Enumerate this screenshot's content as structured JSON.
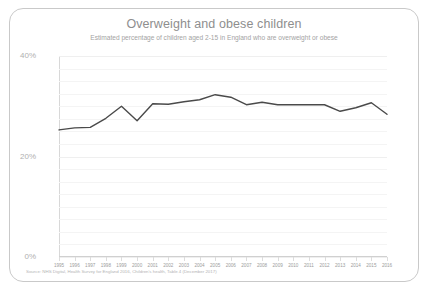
{
  "card": {
    "title": "Overweight and obese children",
    "subtitle": "Estimated percentage of children aged 2-15 in England who are overweight or obese",
    "source": "Source: NHS Digital, Health Survey for England 2016, Children's health, Table 4 (December 2017)",
    "border_color": "#c9c9c9",
    "background": "#ffffff"
  },
  "chart_data": {
    "type": "line",
    "title": "Overweight and obese children",
    "subtitle": "Estimated percentage of children aged 2-15 in England who are overweight or obese",
    "xlabel": "",
    "ylabel": "",
    "ylim": [
      0,
      40
    ],
    "yticks": [
      0,
      20,
      40
    ],
    "ytick_labels": [
      "0%",
      "20%",
      "40%"
    ],
    "grid": true,
    "legend": "none",
    "line_color": "#4a4a4a",
    "categories": [
      "1995",
      "1996",
      "1997",
      "1998",
      "1999",
      "2000",
      "2001",
      "2002",
      "2003",
      "2004",
      "2005",
      "2006",
      "2007",
      "2008",
      "2009",
      "2010",
      "2011",
      "2012",
      "2013",
      "2014",
      "2015",
      "2016"
    ],
    "values": [
      25.3,
      25.7,
      25.8,
      27.6,
      30.0,
      27.1,
      30.5,
      30.4,
      30.9,
      31.3,
      32.3,
      31.8,
      30.3,
      30.8,
      30.3,
      30.3,
      30.3,
      30.3,
      29.0,
      29.7,
      30.7,
      28.4
    ],
    "units": "percent"
  }
}
